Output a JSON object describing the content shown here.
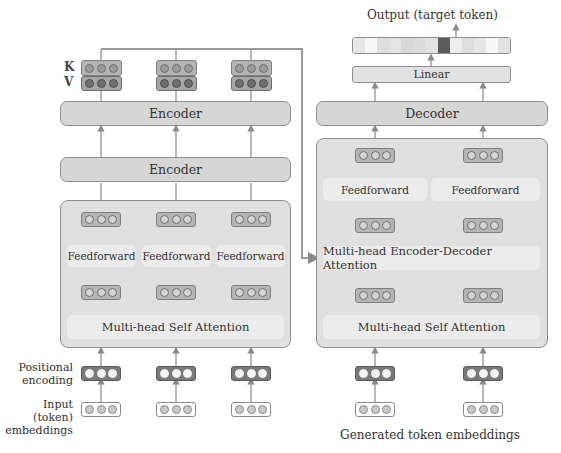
{
  "encoder_side": {
    "kv_labels": {
      "k": "K",
      "v": "V"
    },
    "encoder_top_label": "Encoder",
    "encoder_second_label": "Encoder",
    "feedforward_labels": [
      "Feedforward",
      "Feedforward",
      "Feedforward"
    ],
    "self_attention_label": "Multi-head Self Attention",
    "positional_encoding_label": "Positional\nencoding",
    "positional_encoding_line1": "Positional",
    "positional_encoding_line2": "encoding",
    "input_embeddings_line1": "Input (token)",
    "input_embeddings_line2": "embeddings",
    "columns": 3
  },
  "decoder_side": {
    "output_label": "Output (target token)",
    "linear_label": "Linear",
    "decoder_label": "Decoder",
    "feedforward_labels": [
      "Feedforward",
      "Feedforward"
    ],
    "encoder_decoder_attention_label": "Multi-head Encoder-Decoder Attention",
    "self_attention_label": "Multi-head Self Attention",
    "generated_embeddings_label": "Generated token embeddings",
    "columns": 2,
    "output_distribution_shades": [
      "#e6e6e6",
      "#f4f4f4",
      "#dedede",
      "#e2e2e2",
      "#d9d9d9",
      "#dcdcdc",
      "#e4e4e4",
      "#5a5a5a",
      "#eeeeee",
      "#dedede",
      "#e8e8e8",
      "#f6f6f6",
      "#e3e3e3"
    ]
  },
  "colors": {
    "block_fill": "#e0e0e0",
    "bar_fill": "#d6d6d6",
    "inner_fill": "#ececec",
    "line": "#8a8a8a",
    "selected_token": "#5a5a5a"
  }
}
